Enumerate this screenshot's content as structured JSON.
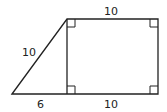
{
  "diagram": {
    "type": "geometry-trapezoid",
    "stroke_color": "#222222",
    "background": "#ffffff",
    "labels": {
      "top": "10",
      "hypotenuse": "10",
      "bottom_left": "6",
      "bottom_right": "10"
    },
    "vertices": {
      "triangle_left": [
        12,
        94
      ],
      "square_top_left": [
        67,
        19
      ],
      "square_top_right": [
        158,
        19
      ],
      "square_bottom_right": [
        158,
        94
      ],
      "square_bottom_left": [
        67,
        94
      ]
    },
    "right_angle_markers": [
      "square_top_left",
      "square_top_right",
      "square_bottom_left",
      "square_bottom_right"
    ]
  }
}
